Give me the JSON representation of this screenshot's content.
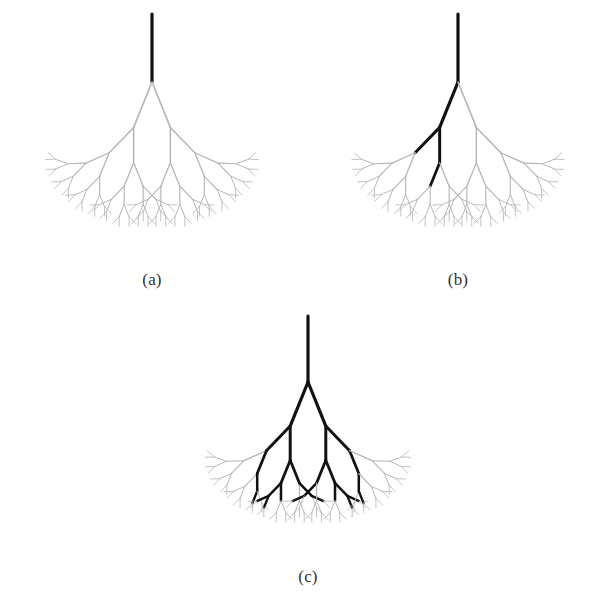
{
  "figure": {
    "type": "recursive-binary-tree-diagram",
    "background_color": "#ffffff",
    "width": 612,
    "height": 609,
    "normal_branch_color": "#b4b4b4",
    "highlighted_branch_color": "#111111",
    "caption_color": "#333333"
  },
  "panels": [
    {
      "id": "a",
      "caption": "(a)",
      "caption_x": 152,
      "caption_y": 281,
      "origin_x": 152,
      "origin_y": 82,
      "stem_top_y": 14,
      "depth": 6,
      "root_length": 68,
      "branch_ratio": 0.72,
      "spread_degrees": 44,
      "highlight_description": "only the root trunk is drawn dark; entire tree is light gray",
      "highlight_paths": []
    },
    {
      "id": "b",
      "caption": "(b)",
      "caption_x": 458,
      "caption_y": 281,
      "origin_x": 458,
      "origin_y": 82,
      "stem_top_y": 14,
      "depth": 6,
      "root_length": 68,
      "branch_ratio": 0.72,
      "spread_degrees": 44,
      "highlight_description": "a single root-to-node path descends into the left subtree, forking once into two short legs",
      "highlight_paths": [
        [
          "L"
        ],
        [
          "L",
          "L"
        ],
        [
          "L",
          "R"
        ],
        [
          "L",
          "R",
          "L"
        ]
      ]
    },
    {
      "id": "c",
      "caption": "(c)",
      "caption_x": 308,
      "caption_y": 578,
      "origin_x": 308,
      "origin_y": 382,
      "stem_top_y": 316,
      "depth": 6,
      "root_length": 66,
      "branch_ratio": 0.72,
      "spread_degrees": 44,
      "highlight_description": "a large symmetric highlighted subtree spanning both halves of the tree down to the leaf row",
      "highlight_paths": [
        [
          "L"
        ],
        [
          "R"
        ],
        [
          "L",
          "L"
        ],
        [
          "L",
          "R"
        ],
        [
          "R",
          "L"
        ],
        [
          "R",
          "R"
        ],
        [
          "L",
          "L",
          "R"
        ],
        [
          "L",
          "R",
          "L"
        ],
        [
          "L",
          "R",
          "R"
        ],
        [
          "R",
          "L",
          "L"
        ],
        [
          "R",
          "L",
          "R"
        ],
        [
          "R",
          "R",
          "L"
        ],
        [
          "L",
          "R",
          "L",
          "L"
        ],
        [
          "L",
          "R",
          "L",
          "R"
        ],
        [
          "R",
          "L",
          "R",
          "L"
        ],
        [
          "R",
          "L",
          "R",
          "R"
        ],
        [
          "L",
          "R",
          "L",
          "L",
          "L"
        ],
        [
          "L",
          "R",
          "L",
          "L",
          "R"
        ],
        [
          "R",
          "L",
          "R",
          "R",
          "L"
        ],
        [
          "R",
          "L",
          "R",
          "R",
          "R"
        ],
        [
          "L",
          "L",
          "R",
          "R"
        ],
        [
          "R",
          "R",
          "L",
          "L"
        ],
        [
          "L",
          "L",
          "R",
          "R",
          "L"
        ],
        [
          "R",
          "R",
          "L",
          "L",
          "R"
        ],
        [
          "L",
          "R",
          "R",
          "R"
        ],
        [
          "R",
          "L",
          "L",
          "L"
        ],
        [
          "L",
          "R",
          "R",
          "R",
          "R"
        ],
        [
          "R",
          "L",
          "L",
          "L",
          "L"
        ]
      ]
    }
  ],
  "captions": {
    "a": "(a)",
    "b": "(b)",
    "c": "(c)"
  }
}
